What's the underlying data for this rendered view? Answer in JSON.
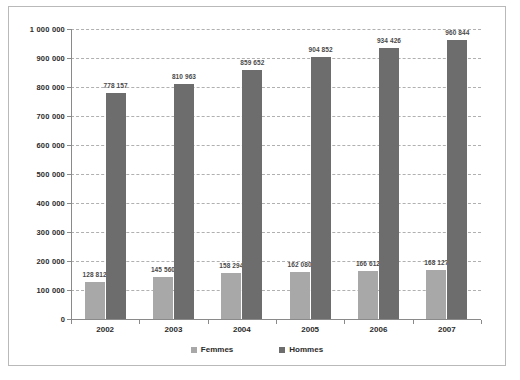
{
  "chart_data": {
    "type": "bar",
    "title": "",
    "xlabel": "",
    "ylabel": "",
    "categories": [
      "2002",
      "2003",
      "2004",
      "2005",
      "2006",
      "2007"
    ],
    "series": [
      {
        "name": "Femmes",
        "color": "#a8a8a8",
        "values": [
          128812,
          145560,
          158294,
          162080,
          166612,
          168127
        ],
        "labels": [
          "128 812",
          "145 560",
          "158 294",
          "162 080",
          "166 612",
          "168 127"
        ]
      },
      {
        "name": "Hommes",
        "color": "#6d6d6d",
        "values": [
          778157,
          810963,
          859652,
          904852,
          934426,
          960844
        ],
        "labels": [
          "778 157",
          "810 963",
          "859 652",
          "904 852",
          "934 426",
          "960 844"
        ]
      }
    ],
    "ylim": [
      0,
      1000000
    ],
    "ytick_values": [
      0,
      100000,
      200000,
      300000,
      400000,
      500000,
      600000,
      700000,
      800000,
      900000,
      1000000
    ],
    "ytick_labels": [
      "0",
      "100 000",
      "200 000",
      "300 000",
      "400 000",
      "500 000",
      "600 000",
      "700 000",
      "800 000",
      "900 000",
      "1 000 000"
    ],
    "grid": true,
    "grid_style": "dashed",
    "legend_position": "bottom"
  },
  "legend": {
    "items": [
      {
        "label": "Femmes"
      },
      {
        "label": "Hommes"
      }
    ]
  }
}
